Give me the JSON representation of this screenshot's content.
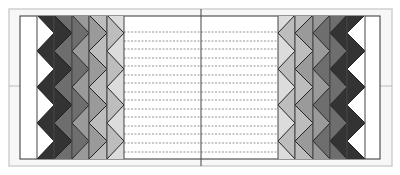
{
  "diagram": {
    "title": "",
    "background": "#ffffff",
    "outer_frame": {
      "x": 9,
      "y": 9,
      "w": 383,
      "h": 157,
      "fill": "#f7f7f7",
      "stroke": "#cfcfcf"
    },
    "inner_box": {
      "x": 20,
      "y": 16,
      "w": 360,
      "h": 143,
      "fill": "#ffffff",
      "stroke": "#333333"
    },
    "center_line": {
      "x": 201,
      "y1": 9,
      "y2": 166,
      "stroke": "#444444"
    },
    "mid_line": {
      "y": 86,
      "x1": 9,
      "x2": 392,
      "stroke": "#bbbbbb"
    },
    "dashed_lines": {
      "x1": 110,
      "x2": 292,
      "stroke": "#777777",
      "ys": [
        32,
        41,
        49,
        58,
        66,
        75,
        83,
        92,
        100,
        109,
        117,
        126,
        134,
        143,
        152
      ]
    },
    "zigzag": {
      "top": 16,
      "bottom": 159,
      "period": 36,
      "first_right_vertex": 33
    },
    "strips_left": [
      {
        "x": 37,
        "w": 17,
        "left_fill": "#ffffff",
        "right_fill": "#333333"
      },
      {
        "x": 54,
        "w": 18,
        "left_fill": "#333333",
        "right_fill": "#6e6e6e"
      },
      {
        "x": 72,
        "w": 17,
        "left_fill": "#6e6e6e",
        "right_fill": "#9a9a9a"
      },
      {
        "x": 89,
        "w": 18,
        "left_fill": "#9a9a9a",
        "right_fill": "#bdbdbd"
      },
      {
        "x": 107,
        "w": 17,
        "left_fill": "#bdbdbd",
        "right_fill": "#dcdcdc"
      }
    ],
    "strips_right": [
      {
        "x": 278,
        "w": 17,
        "left_fill": "#dcdcdc",
        "right_fill": "#bdbdbd"
      },
      {
        "x": 295,
        "w": 18,
        "left_fill": "#bdbdbd",
        "right_fill": "#9a9a9a"
      },
      {
        "x": 313,
        "w": 17,
        "left_fill": "#9a9a9a",
        "right_fill": "#6e6e6e"
      },
      {
        "x": 330,
        "w": 17,
        "left_fill": "#6e6e6e",
        "right_fill": "#333333"
      },
      {
        "x": 347,
        "w": 18,
        "left_fill": "#333333",
        "right_fill": "#ffffff"
      }
    ],
    "zigzag_stroke": "#222222"
  }
}
